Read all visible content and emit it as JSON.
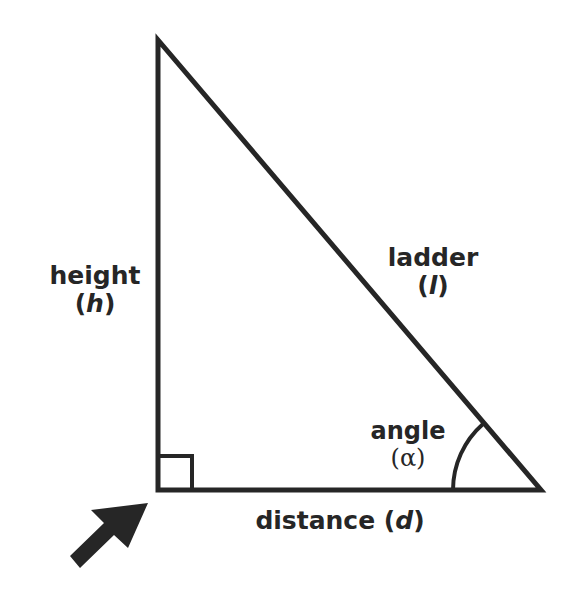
{
  "diagram": {
    "stroke_color": "#262626",
    "background": "#ffffff",
    "labels": {
      "height": {
        "word": "height",
        "open": "(",
        "symbol": "h",
        "close": ")"
      },
      "ladder": {
        "word": "ladder",
        "open": "(",
        "symbol": "l",
        "close": ")"
      },
      "angle": {
        "word": "angle",
        "open": "(",
        "symbol": "α",
        "close": ")"
      },
      "distance": {
        "word": "distance",
        "open": "(",
        "symbol": "d",
        "close": ")"
      }
    },
    "arrow_icon": "arrow-pointing-to-right-angle-corner"
  }
}
